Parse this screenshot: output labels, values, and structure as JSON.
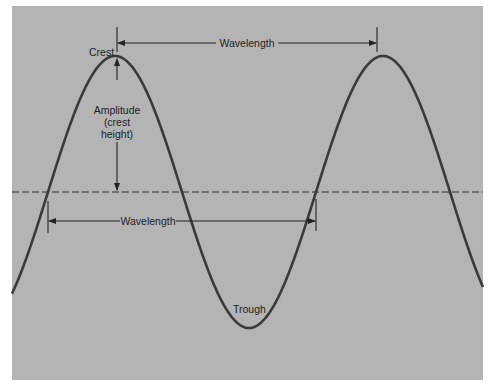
{
  "diagram": {
    "colors": {
      "page_background": "#ffffff",
      "panel_fill": "#b4b4b4",
      "wave_stroke": "#3a3a3a",
      "line_stroke": "#222222",
      "text": "#1e1e1e"
    },
    "labels": {
      "crest": "Crest",
      "trough": "Trough",
      "wavelength_top": "Wavelength",
      "wavelength_bottom": "Wavelength",
      "amplitude_line1": "Amplitude",
      "amplitude_line2": "(crest",
      "amplitude_line3": "height)"
    },
    "geometry": {
      "panel": {
        "x": 12,
        "y": 6,
        "width": 471,
        "height": 374
      },
      "baseline_y": 192,
      "crest_points": [
        [
          117,
          56
        ],
        [
          377,
          56
        ]
      ],
      "trough_point": [
        247,
        327
      ],
      "zero_crossings_x": [
        48,
        182,
        316,
        443
      ]
    }
  }
}
